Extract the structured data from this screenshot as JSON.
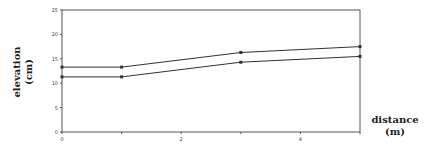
{
  "chart_data": {
    "type": "line",
    "title": "",
    "xlabel": "distance (m)",
    "ylabel": "elevation (cm)",
    "xlabel_lines": [
      "distance",
      "(m)"
    ],
    "ylabel_lines": [
      "elevation",
      "(cm)"
    ],
    "xlim": [
      0,
      5
    ],
    "ylim": [
      0,
      25
    ],
    "x_ticks": [
      0,
      1,
      2,
      3,
      4,
      5
    ],
    "x_tick_labels": [
      "0",
      "",
      "2",
      "",
      "4",
      ""
    ],
    "y_ticks": [
      0,
      5,
      10,
      15,
      20,
      25
    ],
    "y_tick_labels": [
      "0",
      "5",
      "10",
      "15",
      "20",
      "25"
    ],
    "grid": false,
    "legend": null,
    "x": [
      0,
      1,
      3,
      5
    ],
    "series": [
      {
        "name": "upper surface",
        "values": [
          13.3,
          13.3,
          16.3,
          17.5
        ]
      },
      {
        "name": "lower surface",
        "values": [
          11.3,
          11.3,
          14.3,
          15.5
        ]
      }
    ],
    "colors": {
      "line": "#333333",
      "axis": "#555555",
      "frame": "#555555"
    }
  }
}
